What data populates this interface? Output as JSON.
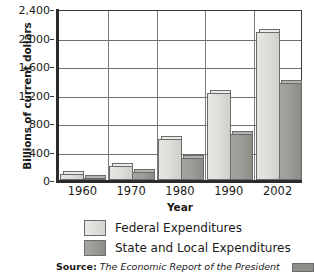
{
  "chart_data": {
    "type": "bar",
    "title": "",
    "xlabel": "Year",
    "ylabel": "Billions of current dollars",
    "categories": [
      "1960",
      "1970",
      "1980",
      "1990",
      "2002"
    ],
    "series": [
      {
        "name": "Federal Expenditures",
        "values": [
          90,
          195,
          570,
          1225,
          2075
        ],
        "color": "#dcdcd8"
      },
      {
        "name": "State and Local Expenditures",
        "values": [
          27,
          115,
          305,
          640,
          1355
        ],
        "color": "#9b9b96"
      }
    ],
    "ylim": [
      0,
      2400
    ],
    "ytick_values": [
      0,
      400,
      800,
      1200,
      1600,
      2000,
      2400
    ],
    "ytick_labels": [
      "0",
      "400",
      "800",
      "1,200",
      "1,600",
      "2,000",
      "2,400"
    ],
    "grid": true,
    "legend_position": "bottom"
  },
  "legend": {
    "items": [
      {
        "label": "Federal Expenditures",
        "swatch": "federal"
      },
      {
        "label": "State and Local Expenditures",
        "swatch": "state"
      }
    ]
  },
  "source": {
    "label": "Source:",
    "text": "The Economic Report of the President"
  }
}
